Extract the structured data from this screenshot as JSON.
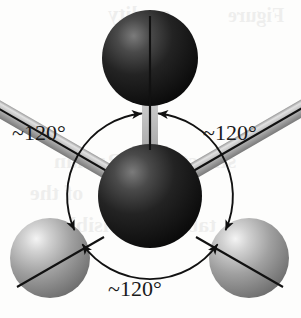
{
  "figure": {
    "type": "ball-and-stick molecular model diagram",
    "labels": {
      "left": "~120°",
      "right": "~120°",
      "bottom": "~120°"
    },
    "angle_value": "~120°",
    "atoms": [
      {
        "id": "center",
        "role": "central atom",
        "shade": "dark",
        "cx": 150,
        "cy": 196,
        "r": 52
      },
      {
        "id": "top",
        "role": "bonded atom",
        "shade": "dark",
        "cx": 150,
        "cy": 58,
        "r": 48
      },
      {
        "id": "bottom-left",
        "role": "bonded atom",
        "shade": "light",
        "cx": 50,
        "cy": 258,
        "r": 40
      },
      {
        "id": "bottom-right",
        "role": "bonded atom",
        "shade": "light",
        "cx": 249,
        "cy": 258,
        "r": 40
      }
    ],
    "bonds": [
      {
        "from": "center",
        "to": "top",
        "angle_deg": 90
      },
      {
        "from": "center",
        "to": "bottom-left",
        "angle_deg": 210
      },
      {
        "from": "center",
        "to": "bottom-right",
        "angle_deg": 330
      }
    ],
    "angle_circle": {
      "cx": 150,
      "cy": 196,
      "r": 83
    },
    "arrow_pairs": [
      {
        "at_bond": "top",
        "count": 2
      },
      {
        "at_bond": "bottom-left",
        "count": 2
      },
      {
        "at_bond": "bottom-right",
        "count": 2
      }
    ],
    "colors": {
      "background": "#fdfdfc",
      "dark_atom": "#141414",
      "dark_atom_highlight": "#6a6a6a",
      "light_atom": "#8e8e8e",
      "light_atom_highlight": "#efefef",
      "bond": "#b4b4b4",
      "bond_core_line": "#111111",
      "arc_stroke": "#111111",
      "label_text": "#1a1a1a"
    }
  },
  "ghost_text": [
    {
      "text": "quality",
      "x": 108,
      "y": 2,
      "size": 21
    },
    {
      "text": "Figure",
      "x": 228,
      "y": 4,
      "size": 20
    },
    {
      "text": "Raman",
      "x": 54,
      "y": 148,
      "size": 22
    },
    {
      "text": "structure",
      "x": 150,
      "y": 148,
      "size": 22
    },
    {
      "text": "of the",
      "x": 30,
      "y": 180,
      "size": 22
    },
    {
      "text": "molecule",
      "x": 120,
      "y": 180,
      "size": 22
    },
    {
      "text": "visible",
      "x": 60,
      "y": 212,
      "size": 22
    },
    {
      "text": "table",
      "x": 170,
      "y": 212,
      "size": 22
    }
  ]
}
